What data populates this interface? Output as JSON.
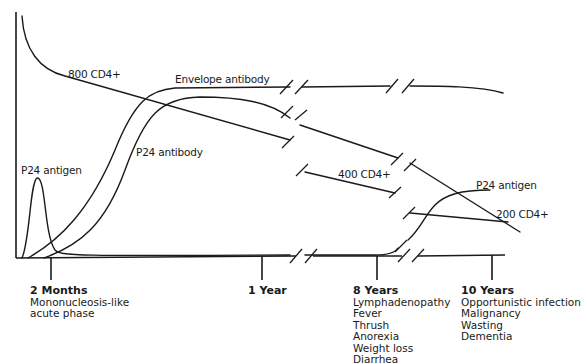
{
  "diagram": {
    "type": "disease-progression-timeline",
    "curve_labels": {
      "cd4_800": "800 CD4+",
      "envelope_antibody": "Envelope antibody",
      "p24_antibody": "P24 antibody",
      "p24_antigen_early": "P24 antigen",
      "cd4_400": "400 CD4+",
      "p24_antigen_late": "P24 antigen",
      "cd4_200": "200 CD4+"
    },
    "timeline": [
      {
        "title": "2 Months",
        "lines": [
          "Mononucleosis-like",
          "acute phase"
        ]
      },
      {
        "title": "1 Year",
        "lines": []
      },
      {
        "title": "8 Years",
        "lines": [
          "Lymphadenopathy",
          "Fever",
          "Thrush",
          "Anorexia",
          "Weight loss",
          "Diarrhea"
        ]
      },
      {
        "title": "10 Years",
        "lines": [
          "Opportunistic infection",
          "Malignancy",
          "Wasting",
          "Dementia"
        ]
      }
    ],
    "colors": {
      "line": "#1a1a1a",
      "background": "#ffffff"
    }
  }
}
